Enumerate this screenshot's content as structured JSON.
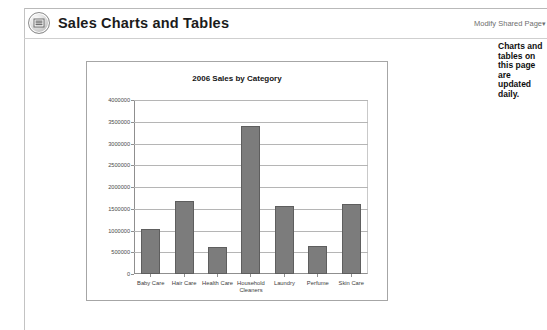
{
  "header": {
    "icon": "list-circle-icon",
    "title": "Sales Charts and Tables",
    "modify_link": "Modify Shared Page",
    "modify_caret": "▾"
  },
  "sidebar": {
    "note": "Charts and tables on this page are updated daily."
  },
  "chart_data": {
    "type": "bar",
    "title": "2006 Sales by Category",
    "xlabel": "",
    "ylabel": "",
    "categories": [
      "Baby Care",
      "Hair Care",
      "Health Care",
      "Household Cleaners",
      "Laundry",
      "Perfume",
      "Skin Care"
    ],
    "values": [
      1030000,
      1680000,
      620000,
      3400000,
      1570000,
      640000,
      1600000
    ],
    "ylim": [
      0,
      4000000
    ],
    "yticks": [
      0,
      500000,
      1000000,
      1500000,
      2000000,
      2500000,
      3000000,
      3500000,
      4000000
    ],
    "ytick_labels": [
      "0",
      "500000",
      "1000000",
      "1500000",
      "2000000",
      "2500000",
      "3000000",
      "3500000",
      "4000000"
    ],
    "grid": true,
    "legend": false,
    "bar_color": "#7c7c7c",
    "bar_border_color": "#5e5e5e",
    "grid_color": "#b5b5b5",
    "axis_color": "#8f8f8f",
    "plot_background": "#ffffff"
  }
}
